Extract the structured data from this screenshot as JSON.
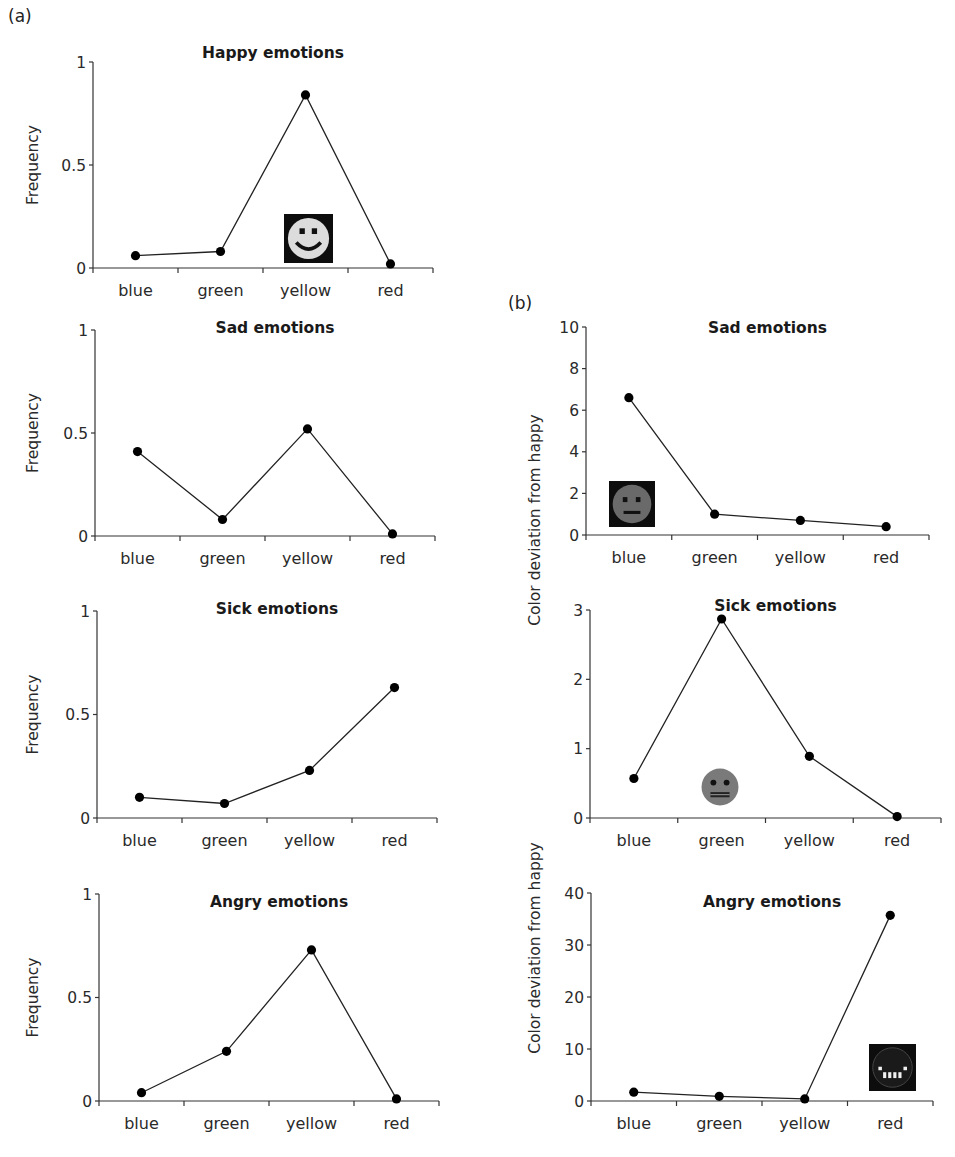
{
  "panels": {
    "a_label": "(a)",
    "b_label": "(b)"
  },
  "chart_data": [
    {
      "id": "a-happy",
      "panel": "(a)",
      "type": "line",
      "title": "Happy emotions",
      "xlabel": "",
      "ylabel": "Frequency",
      "categories": [
        "blue",
        "green",
        "yellow",
        "red"
      ],
      "values": [
        0.06,
        0.08,
        0.84,
        0.02
      ],
      "ylim": [
        0,
        1
      ],
      "yticks": [
        0,
        0.5,
        1
      ],
      "ytick_labels": [
        "0",
        "0.5",
        "1"
      ],
      "grid": false,
      "annotation_icon": "happy-face-icon"
    },
    {
      "id": "a-sad",
      "panel": "(a)",
      "type": "line",
      "title": "Sad emotions",
      "xlabel": "",
      "ylabel": "Frequency",
      "categories": [
        "blue",
        "green",
        "yellow",
        "red"
      ],
      "values": [
        0.41,
        0.08,
        0.52,
        0.01
      ],
      "ylim": [
        0,
        1
      ],
      "yticks": [
        0,
        0.5,
        1
      ],
      "ytick_labels": [
        "0",
        "0.5",
        "1"
      ],
      "grid": false
    },
    {
      "id": "a-sick",
      "panel": "(a)",
      "type": "line",
      "title": "Sick emotions",
      "xlabel": "",
      "ylabel": "Frequency",
      "categories": [
        "blue",
        "green",
        "yellow",
        "red"
      ],
      "values": [
        0.1,
        0.07,
        0.23,
        0.63
      ],
      "ylim": [
        0,
        1
      ],
      "yticks": [
        0,
        0.5,
        1
      ],
      "ytick_labels": [
        "0",
        "0.5",
        "1"
      ],
      "grid": false
    },
    {
      "id": "a-angry",
      "panel": "(a)",
      "type": "line",
      "title": "Angry emotions",
      "xlabel": "",
      "ylabel": "Frequency",
      "categories": [
        "blue",
        "green",
        "yellow",
        "red"
      ],
      "values": [
        0.04,
        0.24,
        0.73,
        0.01
      ],
      "ylim": [
        0,
        1
      ],
      "yticks": [
        0,
        0.5,
        1
      ],
      "ytick_labels": [
        "0",
        "0.5",
        "1"
      ],
      "grid": false
    },
    {
      "id": "b-sad",
      "panel": "(b)",
      "type": "line",
      "title": "Sad emotions",
      "xlabel": "",
      "ylabel": "Color deviation from happy",
      "categories": [
        "blue",
        "green",
        "yellow",
        "red"
      ],
      "values": [
        6.6,
        1.0,
        0.7,
        0.4
      ],
      "ylim": [
        0,
        10
      ],
      "yticks": [
        0,
        2,
        4,
        6,
        8,
        10
      ],
      "ytick_labels": [
        "0",
        "2",
        "4",
        "6",
        "8",
        "10"
      ],
      "grid": false,
      "annotation_icon": "sad-face-icon"
    },
    {
      "id": "b-sick",
      "panel": "(b)",
      "type": "line",
      "title": "Sick emotions",
      "xlabel": "",
      "ylabel": "Color deviation from happy",
      "categories": [
        "blue",
        "green",
        "yellow",
        "red"
      ],
      "values": [
        0.57,
        2.87,
        0.89,
        0.02
      ],
      "ylim": [
        0,
        3
      ],
      "yticks": [
        0,
        1,
        2,
        3
      ],
      "ytick_labels": [
        "0",
        "1",
        "2",
        "3"
      ],
      "grid": false,
      "annotation_icon": "sick-face-icon"
    },
    {
      "id": "b-angry",
      "panel": "(b)",
      "type": "line",
      "title": "Angry emotions",
      "xlabel": "",
      "ylabel": "Color deviation from happy",
      "categories": [
        "blue",
        "green",
        "yellow",
        "red"
      ],
      "values": [
        1.7,
        0.9,
        0.4,
        35.7
      ],
      "ylim": [
        0,
        40
      ],
      "yticks": [
        0,
        10,
        20,
        30,
        40
      ],
      "ytick_labels": [
        "0",
        "10",
        "20",
        "30",
        "40"
      ],
      "grid": false,
      "annotation_icon": "angry-face-icon"
    }
  ],
  "shared_ylabels": {
    "b_upper": "Color deviation from happy",
    "b_lower": "Color deviation from happy"
  }
}
